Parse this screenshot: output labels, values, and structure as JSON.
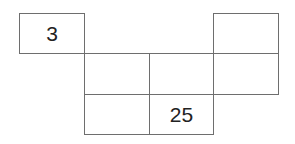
{
  "diagram": {
    "type": "number-grid-puzzle",
    "cells": [
      {
        "row": 0,
        "col": 0,
        "value": "3"
      },
      {
        "row": 0,
        "col": 3,
        "value": ""
      },
      {
        "row": 1,
        "col": 1,
        "value": ""
      },
      {
        "row": 1,
        "col": 2,
        "value": ""
      },
      {
        "row": 1,
        "col": 3,
        "value": ""
      },
      {
        "row": 2,
        "col": 1,
        "value": ""
      },
      {
        "row": 2,
        "col": 2,
        "value": "25"
      }
    ]
  }
}
